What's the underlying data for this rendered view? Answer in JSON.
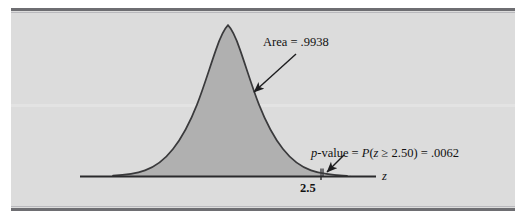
{
  "figure": {
    "panel_background": "#dcdcdc",
    "rule_color": "#6e6e72",
    "curve_stroke": "#3a3a3c",
    "body_fill": "#b0b0b0",
    "tail_fill": "#8a8a8a",
    "axis_color": "#2a2a2c"
  },
  "annotations": {
    "area_label": "Area = .9938",
    "pvalue_label": "p-value = P(z ≥ 2.50) = .0062",
    "tick_label": "2.5",
    "axis_label": "z"
  },
  "chart_data": {
    "type": "area",
    "title": "",
    "subtitle": "",
    "xlabel": "z",
    "ylabel": "",
    "grid": false,
    "legend": "none",
    "distribution": "standard normal",
    "mean": 0,
    "sd": 1,
    "xlim": [
      -4.0,
      4.0
    ],
    "ylim": [
      0,
      0.42
    ],
    "tick_values": [
      2.5
    ],
    "tick_labels": [
      "2.5"
    ],
    "regions": [
      {
        "name": "body",
        "label": "Area = .9938",
        "from": -4.0,
        "to": 2.5,
        "area": 0.9938,
        "fill": "#b0b0b0"
      },
      {
        "name": "upper-tail",
        "label": "p-value = P(z ≥ 2.50) = .0062",
        "from": 2.5,
        "to": 4.0,
        "area": 0.0062,
        "fill": "#8a8a8a"
      }
    ],
    "test": {
      "statistic_symbol": "z",
      "critical_value": 2.5,
      "p_value": 0.0062,
      "cumulative_below": 0.9938,
      "tail": "upper"
    },
    "annotations": [
      {
        "text": "Area = .9938",
        "points_to_x": 1.0,
        "points_to_y": 0.17
      },
      {
        "text": "p-value = P(z ≥ 2.50) = .0062",
        "points_to_x": 2.62,
        "points_to_y": 0.02
      }
    ]
  }
}
